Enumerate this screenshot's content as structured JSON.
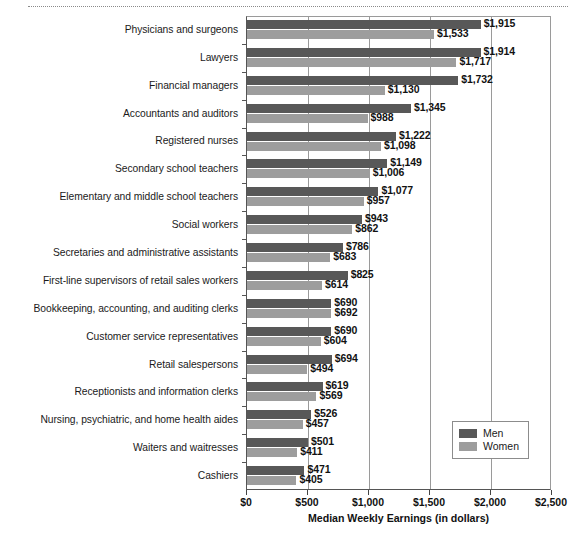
{
  "chart_data": {
    "type": "bar",
    "orientation": "horizontal",
    "title": "",
    "xlabel": "Median Weekly Earnings (in dollars)",
    "ylabel": "",
    "xlim": [
      0,
      2500
    ],
    "xticks": [
      0,
      500,
      1000,
      1500,
      2000,
      2500
    ],
    "xtick_labels": [
      "$0",
      "$500",
      "$1,000",
      "$1,500",
      "$2,000",
      "$2,500"
    ],
    "grid": true,
    "legend_position": "bottom-right",
    "categories": [
      "Physicians and surgeons",
      "Lawyers",
      "Financial managers",
      "Accountants and auditors",
      "Registered nurses",
      "Secondary school teachers",
      "Elementary and middle school teachers",
      "Social workers",
      "Secretaries and administrative assistants",
      "First-line supervisors of retail sales workers",
      "Bookkeeping, accounting, and auditing clerks",
      "Customer service representatives",
      "Retail salespersons",
      "Receptionists and information clerks",
      "Nursing, psychiatric, and home health aides",
      "Waiters and waitresses",
      "Cashiers"
    ],
    "series": [
      {
        "name": "Men",
        "color": "#585858",
        "values": [
          1915,
          1914,
          1732,
          1345,
          1222,
          1149,
          1077,
          943,
          786,
          825,
          690,
          690,
          694,
          619,
          526,
          501,
          471
        ],
        "value_labels": [
          "$1,915",
          "$1,914",
          "$1,732",
          "$1,345",
          "$1,222",
          "$1,149",
          "$1,077",
          "$943",
          "$786",
          "$825",
          "$690",
          "$690",
          "$694",
          "$619",
          "$526",
          "$501",
          "$471"
        ]
      },
      {
        "name": "Women",
        "color": "#9d9d9d",
        "values": [
          1533,
          1717,
          1130,
          988,
          1098,
          1006,
          957,
          862,
          683,
          614,
          692,
          604,
          494,
          569,
          457,
          411,
          405
        ],
        "value_labels": [
          "$1,533",
          "$1,717",
          "$1,130",
          "$988",
          "$1,098",
          "$1,006",
          "$957",
          "$862",
          "$683",
          "$614",
          "$692",
          "$604",
          "$494",
          "$569",
          "$457",
          "$411",
          "$405"
        ]
      }
    ]
  },
  "legend": {
    "items": [
      {
        "label": "Men",
        "color": "#585858"
      },
      {
        "label": "Women",
        "color": "#9d9d9d"
      }
    ]
  },
  "axis": {
    "x_title": "Median Weekly Earnings (in dollars)"
  }
}
